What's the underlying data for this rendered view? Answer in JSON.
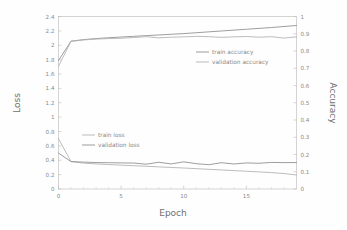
{
  "chart_data": {
    "type": "line",
    "title": "",
    "xlabel": "Epoch",
    "ylabel": "Loss",
    "y2label": "Accuracy",
    "xlim": [
      0,
      19
    ],
    "ylim": [
      0,
      2.4
    ],
    "y2lim": [
      0,
      1
    ],
    "grid": false,
    "x_ticks": [
      0,
      5,
      10,
      15
    ],
    "x_tick_labels": [
      "0",
      "5",
      "10",
      "15"
    ],
    "x_minor_ticks": [
      1,
      2,
      3,
      4,
      6,
      7,
      8,
      9,
      11,
      12,
      13,
      14,
      16,
      17,
      18,
      19
    ],
    "y_ticks": [
      0,
      0.2,
      0.4,
      0.6,
      0.8,
      1,
      1.2,
      1.4,
      1.6,
      1.8,
      2,
      2.2,
      2.4
    ],
    "y_tick_labels": [
      "0",
      "0.2",
      "0.4",
      "0.6",
      "0.8",
      "1",
      "1.2",
      "1.4",
      "1.6",
      "1.8",
      "2",
      "2.2",
      "2.4"
    ],
    "y2_ticks": [
      0,
      0.1,
      0.2,
      0.3,
      0.4,
      0.5,
      0.6,
      0.7,
      0.8,
      0.9,
      1
    ],
    "y2_tick_labels": [
      "0",
      "0.1",
      "0.2",
      "0.3",
      "0.4",
      "0.5",
      "0.6",
      "0.7",
      "0.8",
      "0.9",
      "1"
    ],
    "x": [
      0,
      1,
      2,
      3,
      4,
      5,
      6,
      7,
      8,
      9,
      10,
      11,
      12,
      13,
      14,
      15,
      16,
      17,
      18,
      19
    ],
    "series": [
      {
        "name": "train accuracy",
        "axis": "right",
        "color": "#8c8c8c",
        "values": [
          0.745,
          0.857,
          0.866,
          0.872,
          0.877,
          0.881,
          0.885,
          0.889,
          0.893,
          0.897,
          0.901,
          0.906,
          0.911,
          0.916,
          0.921,
          0.926,
          0.931,
          0.936,
          0.942,
          0.948
        ]
      },
      {
        "name": "validation accuracy",
        "axis": "right",
        "color": "#b0b0b0",
        "values": [
          0.712,
          0.856,
          0.864,
          0.869,
          0.872,
          0.874,
          0.878,
          0.883,
          0.876,
          0.88,
          0.882,
          0.885,
          0.883,
          0.879,
          0.882,
          0.884,
          0.88,
          0.883,
          0.875,
          0.882
        ]
      },
      {
        "name": "train loss",
        "axis": "left",
        "color": "#b0b0b0",
        "values": [
          0.7,
          0.383,
          0.36,
          0.349,
          0.34,
          0.332,
          0.324,
          0.316,
          0.308,
          0.3,
          0.292,
          0.283,
          0.274,
          0.265,
          0.256,
          0.247,
          0.238,
          0.228,
          0.215,
          0.195
        ]
      },
      {
        "name": "validation loss",
        "axis": "left",
        "color": "#8c8c8c",
        "values": [
          0.5,
          0.381,
          0.374,
          0.368,
          0.366,
          0.363,
          0.361,
          0.345,
          0.372,
          0.349,
          0.378,
          0.352,
          0.338,
          0.366,
          0.348,
          0.363,
          0.358,
          0.37,
          0.367,
          0.368
        ]
      }
    ],
    "legends": [
      {
        "name": "accuracy-legend",
        "entries": [
          {
            "label": "train accuracy",
            "color": "#8c8c8c"
          },
          {
            "label": "validation accuracy",
            "color": "#b0b0b0"
          }
        ]
      },
      {
        "name": "loss-legend",
        "entries": [
          {
            "label": "train loss",
            "color": "#b0b0b0"
          },
          {
            "label": "validation loss",
            "color": "#8c8c8c"
          }
        ]
      }
    ]
  }
}
